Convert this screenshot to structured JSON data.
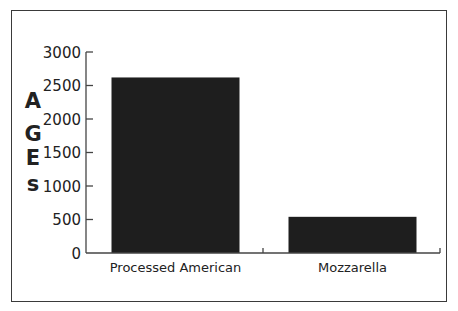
{
  "chart_data": {
    "type": "bar",
    "title": "",
    "xlabel": "",
    "ylabel": "AGEs",
    "ylabel_letters": [
      "A",
      "G",
      "E",
      "s"
    ],
    "categories": [
      "Processed American",
      "Mozzarella"
    ],
    "values": [
      2620,
      540
    ],
    "ylim": [
      0,
      3000
    ],
    "yticks": [
      0,
      500,
      1000,
      1500,
      2000,
      2500,
      3000
    ],
    "ytick_labels": [
      "0",
      "500",
      "1000",
      "1500",
      "2000",
      "2500",
      "3000"
    ],
    "grid": false,
    "legend": null,
    "bar_color": "#1e1e1e"
  }
}
